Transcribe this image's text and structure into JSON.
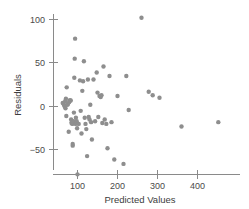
{
  "chart_data": {
    "type": "scatter",
    "title": "",
    "xlabel": "Predicted Values",
    "ylabel": "Residuals",
    "xlim": [
      40,
      470
    ],
    "ylim": [
      -85,
      112
    ],
    "xticks": [
      100,
      200,
      300,
      400
    ],
    "yticks": [
      -50,
      0,
      50,
      100
    ],
    "xtick_labels": [
      "100",
      "200",
      "300",
      "400"
    ],
    "ytick_labels": [
      "−50",
      "0",
      "50",
      "100"
    ],
    "grid": false,
    "legend": null,
    "marker": {
      "shape": "circle",
      "color": "#8e8e8e",
      "size": 2.2
    },
    "n_points": 73,
    "points": [
      [
        63,
        4
      ],
      [
        66,
        2
      ],
      [
        68,
        0
      ],
      [
        69,
        6
      ],
      [
        70,
        -2
      ],
      [
        71,
        9
      ],
      [
        72,
        -11
      ],
      [
        73,
        22
      ],
      [
        75,
        2
      ],
      [
        76,
        3
      ],
      [
        78,
        -29
      ],
      [
        79,
        5
      ],
      [
        80,
        7
      ],
      [
        82,
        7
      ],
      [
        83,
        7
      ],
      [
        84,
        -15
      ],
      [
        85,
        -19
      ],
      [
        86,
        -18
      ],
      [
        87,
        -20
      ],
      [
        88,
        -43
      ],
      [
        88,
        -45
      ],
      [
        90,
        -17
      ],
      [
        91,
        -7
      ],
      [
        92,
        33
      ],
      [
        93,
        55
      ],
      [
        94,
        78
      ],
      [
        95,
        -20
      ],
      [
        96,
        -13
      ],
      [
        98,
        -17
      ],
      [
        99,
        -25
      ],
      [
        100,
        -78
      ],
      [
        103,
        -20
      ],
      [
        106,
        30
      ],
      [
        108,
        -5
      ],
      [
        110,
        -31
      ],
      [
        112,
        18
      ],
      [
        114,
        29
      ],
      [
        116,
        52
      ],
      [
        118,
        -13
      ],
      [
        120,
        -20
      ],
      [
        122,
        -26
      ],
      [
        124,
        -57
      ],
      [
        126,
        31
      ],
      [
        128,
        -12
      ],
      [
        130,
        -15
      ],
      [
        132,
        2
      ],
      [
        134,
        -18
      ],
      [
        136,
        -38
      ],
      [
        140,
        31
      ],
      [
        144,
        -17
      ],
      [
        148,
        39
      ],
      [
        150,
        16
      ],
      [
        152,
        -12
      ],
      [
        155,
        12
      ],
      [
        158,
        11
      ],
      [
        160,
        13
      ],
      [
        162,
        -19
      ],
      [
        165,
        46
      ],
      [
        168,
        -15
      ],
      [
        172,
        -20
      ],
      [
        175,
        -48
      ],
      [
        180,
        35
      ],
      [
        185,
        -18
      ],
      [
        192,
        -61
      ],
      [
        200,
        12
      ],
      [
        215,
        -66
      ],
      [
        222,
        35
      ],
      [
        228,
        -4
      ],
      [
        260,
        102
      ],
      [
        278,
        17
      ],
      [
        288,
        13
      ],
      [
        305,
        10
      ],
      [
        360,
        -23
      ],
      [
        452,
        -18
      ]
    ]
  }
}
